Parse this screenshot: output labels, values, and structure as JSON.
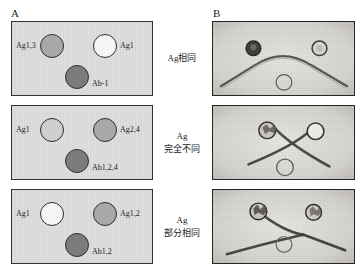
{
  "figure": {
    "panels": {
      "a_letter": "A",
      "b_letter": "B"
    }
  },
  "colors": {
    "gel_background": "#dcdcdc",
    "photo_background": "#d9d7d2",
    "well_outline": "#2b2b2b",
    "box_border": "#333333",
    "precipitin_line": "#3a3a3a",
    "well_fill_white": "#f7f7f7",
    "well_fill_mid": "#a8a8a8",
    "well_fill_light": "#cfcfcf",
    "well_fill_dark": "#7a7a7a"
  },
  "rows": [
    {
      "id": "identity",
      "caption_lines": [
        "Ag相同"
      ],
      "schematic": {
        "left_well": {
          "label": "Ag1,3",
          "fill": "mid"
        },
        "right_well": {
          "label": "Ag1",
          "fill": "white"
        },
        "bottom_well": {
          "label": "Ab-1",
          "fill": "dark"
        }
      },
      "photo": {
        "pattern": "arch-fusion"
      }
    },
    {
      "id": "non-identity",
      "caption_lines": [
        "Ag",
        "完全不同"
      ],
      "schematic": {
        "left_well": {
          "label": "Ag1",
          "fill": "light"
        },
        "right_well": {
          "label": "Ag2,4",
          "fill": "mid"
        },
        "bottom_well": {
          "label": "Ab1,2,4",
          "fill": "dark"
        }
      },
      "photo": {
        "pattern": "crossed-lines"
      }
    },
    {
      "id": "partial-identity",
      "caption_lines": [
        "Ag",
        "部分相同"
      ],
      "schematic": {
        "left_well": {
          "label": "Ag1",
          "fill": "white"
        },
        "right_well": {
          "label": "Ag1,2",
          "fill": "mid"
        },
        "bottom_well": {
          "label": "Ab1,2",
          "fill": "dark"
        }
      },
      "photo": {
        "pattern": "spur"
      }
    }
  ]
}
